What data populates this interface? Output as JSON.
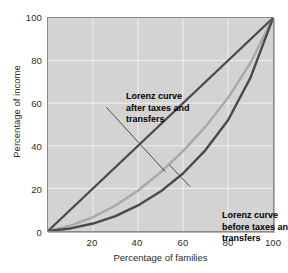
{
  "figure": {
    "name": "lorenz-curve-figure",
    "background": "#ffffff",
    "plot_background": "#d3d3d3",
    "gridline_color": "#ffffff",
    "frame_color": "#8a8a8a"
  },
  "axes": {
    "xlabel": "Percentage of families",
    "ylabel": "Percentage of income",
    "xticks": [
      "20",
      "40",
      "60",
      "80",
      "100"
    ],
    "yticks": [
      "0",
      "20",
      "40",
      "60",
      "80",
      "100"
    ]
  },
  "annotations": {
    "after": {
      "line1": "Lorenz curve",
      "line2": "after taxes and",
      "line3": "transfers"
    },
    "before": {
      "line1": "Lorenz curve",
      "line2": "before taxes and",
      "line3": "transfers"
    }
  },
  "chart_data": {
    "type": "line",
    "title": "",
    "xlabel": "Percentage of families",
    "ylabel": "Percentage of income",
    "xlim": [
      0,
      100
    ],
    "ylim": [
      0,
      100
    ],
    "xticks": [
      20,
      40,
      60,
      80,
      100
    ],
    "yticks": [
      0,
      20,
      40,
      60,
      80,
      100
    ],
    "grid": true,
    "legend": "annotations-with-leader-lines",
    "series": [
      {
        "name": "Line of equality",
        "color": "#4a4a4a",
        "width": 2.2,
        "x": [
          0,
          100
        ],
        "y": [
          0,
          100
        ]
      },
      {
        "name": "Lorenz curve after taxes and transfers",
        "color": "#a8a8a8",
        "width": 2.4,
        "x": [
          0,
          10,
          20,
          30,
          40,
          50,
          60,
          70,
          80,
          90,
          100
        ],
        "y": [
          0,
          2.5,
          6.5,
          12,
          19,
          27.5,
          37.5,
          49,
          62.5,
          79,
          100
        ]
      },
      {
        "name": "Lorenz curve before taxes and transfers",
        "color": "#4a4a4a",
        "width": 2.4,
        "x": [
          0,
          10,
          20,
          30,
          40,
          50,
          60,
          70,
          80,
          90,
          100
        ],
        "y": [
          0,
          1.2,
          3.5,
          7,
          12,
          18.5,
          27,
          38,
          52,
          72,
          100
        ]
      }
    ],
    "leader_lines": [
      {
        "name": "leader-after-taxes",
        "from": [
          26,
          58
        ],
        "to": [
          52,
          28
        ],
        "color": "#4a4a4a"
      },
      {
        "name": "leader-before-taxes",
        "from": [
          63,
          21
        ],
        "to": [
          54,
          31
        ],
        "color": "#4a4a4a"
      }
    ]
  }
}
